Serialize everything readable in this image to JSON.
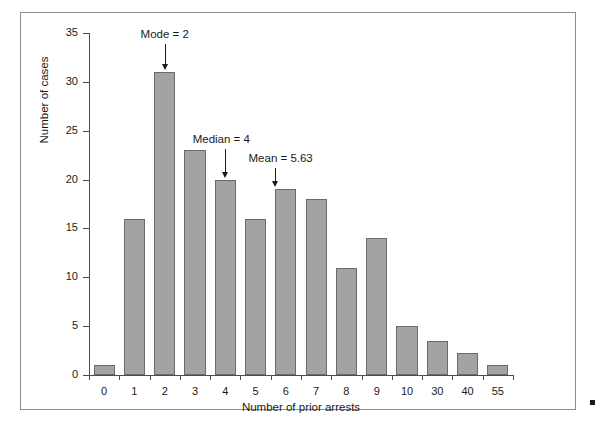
{
  "figure": {
    "frame_border_color": "#8d8d8d",
    "background": "#ffffff",
    "corner_dot_name": "corner-marker-dot"
  },
  "chart_data": {
    "type": "bar",
    "title": "",
    "subtitle": "",
    "xlabel": "Number of prior arrests",
    "ylabel": "Number of cases",
    "categories": [
      "0",
      "1",
      "2",
      "3",
      "4",
      "5",
      "6",
      "7",
      "8",
      "9",
      "10",
      "30",
      "40",
      "55"
    ],
    "values": [
      1,
      16,
      31,
      23,
      20,
      16,
      19,
      18,
      11,
      14,
      5,
      3.5,
      2.3,
      1
    ],
    "ylim": [
      0,
      35
    ],
    "yticks": [
      0,
      5,
      10,
      15,
      20,
      25,
      30,
      35
    ],
    "ytick_labels": [
      "0",
      "5",
      "10",
      "15",
      "20",
      "25",
      "30",
      "35"
    ],
    "grid": false,
    "legend": null,
    "bar_fill_color": "#a3a3a3",
    "bar_edge_color": "#6b6b6b",
    "annotations": [
      {
        "text": "Mode = 2",
        "target_category": "2",
        "target_value": 31
      },
      {
        "text": "Median = 4",
        "target_category": "4",
        "target_value": 20
      },
      {
        "text": "Mean = 5.63",
        "target_category": "5.63",
        "target_value": 19
      }
    ]
  }
}
